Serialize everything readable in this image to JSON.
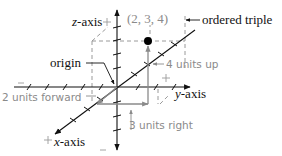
{
  "diagram": {
    "labels": {
      "z_axis_var": "z",
      "z_axis_suffix": "-axis",
      "y_axis_var": "y",
      "y_axis_suffix": "-axis",
      "x_axis_var": "x",
      "x_axis_suffix": "-axis",
      "origin": "origin",
      "ordered_triple": "ordered triple",
      "point": "(2, 3, 4)",
      "forward": "2 units forward",
      "up": "4 units up",
      "right": "3 units right"
    },
    "sign_markers": {
      "plus": "+",
      "minus": "−"
    },
    "point": {
      "x": 2,
      "y": 3,
      "z": 4
    },
    "colors": {
      "axis": "#111111",
      "guide": "#8a8a8a",
      "dashed_box": "#9a9a9a",
      "point": "#000000",
      "background": "#ffffff"
    }
  }
}
